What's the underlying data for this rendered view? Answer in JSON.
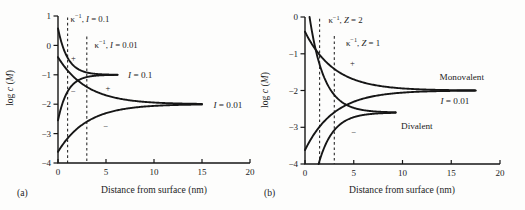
{
  "figure": {
    "background": "#fdfdfc",
    "line_color": "#161616",
    "dash_color": "#2b2b2b",
    "text_color": "#1c1c1c"
  },
  "chart_data": [
    {
      "type": "line",
      "panel_label": "(a)",
      "xlabel": "Distance from surface (nm)",
      "ylabel_parts": [
        {
          "t": "log "
        },
        {
          "t": "c",
          "style": "italic"
        },
        {
          "t": " ("
        },
        {
          "t": "M",
          "style": "italic"
        },
        {
          "t": ")"
        }
      ],
      "xlim": [
        0,
        20
      ],
      "ylim": [
        -4,
        1
      ],
      "xticks": [
        0,
        5,
        10,
        15,
        20
      ],
      "yticks": [
        1,
        0,
        -1,
        -2,
        -3,
        -4
      ],
      "debye_lines": [
        {
          "x_nm": 1.0,
          "y_top": 0.95,
          "label_parts": [
            {
              "t": "κ"
            },
            {
              "t": "−1",
              "style": "sup"
            },
            {
              "t": ", "
            },
            {
              "t": "I",
              "style": "italic"
            },
            {
              "t": " = 0.1"
            }
          ],
          "label_at": {
            "x": 1.3,
            "y": 0.91
          }
        },
        {
          "x_nm": 3.0,
          "y_top": 0.3,
          "label_parts": [
            {
              "t": "κ"
            },
            {
              "t": "−1",
              "style": "sup"
            },
            {
              "t": ", "
            },
            {
              "t": "I",
              "style": "italic"
            },
            {
              "t": " = 0.01"
            }
          ],
          "label_at": {
            "x": 3.8,
            "y": 0.03
          }
        }
      ],
      "series": [
        {
          "name": "counterion-I-0.1",
          "ion_sign": "+",
          "bulk_log_c": -1,
          "surface_delta": 1.58,
          "decay_nm": 1.0,
          "x_end_nm": 6.2
        },
        {
          "name": "coion-I-0.1",
          "ion_sign": "−",
          "bulk_log_c": -1,
          "surface_delta": -1.55,
          "decay_nm": 1.0,
          "x_end_nm": 6.2
        },
        {
          "name": "counterion-I-0.01",
          "ion_sign": "+",
          "bulk_log_c": -2,
          "surface_delta": 1.6,
          "decay_nm": 3.0,
          "x_end_nm": 15.0
        },
        {
          "name": "coion-I-0.01",
          "ion_sign": "−",
          "bulk_log_c": -2,
          "surface_delta": -1.62,
          "decay_nm": 3.0,
          "x_end_nm": 15.0
        }
      ],
      "curve_labels": [
        {
          "parts": [
            {
              "t": "I",
              "style": "italic"
            },
            {
              "t": " = 0.1"
            }
          ],
          "x": 7.3,
          "y": -1.0
        },
        {
          "parts": [
            {
              "t": "I",
              "style": "italic"
            },
            {
              "t": " = 0.01"
            }
          ],
          "x": 16.2,
          "y": -2.02
        }
      ],
      "sign_markers": [
        {
          "t": "+",
          "x": 1.6,
          "y": -0.43
        },
        {
          "t": "−",
          "x": 1.6,
          "y": -1.56
        },
        {
          "t": "+",
          "x": 5.2,
          "y": -1.44
        },
        {
          "t": "−",
          "x": 5.0,
          "y": -2.75
        }
      ]
    },
    {
      "type": "line",
      "panel_label": "(b)",
      "xlabel": "Distance from surface (nm)",
      "ylabel_parts": [
        {
          "t": "log "
        },
        {
          "t": "c",
          "style": "italic"
        },
        {
          "t": " ("
        },
        {
          "t": "M",
          "style": "italic"
        },
        {
          "t": ")"
        }
      ],
      "xlim": [
        0,
        20
      ],
      "ylim": [
        -4,
        0
      ],
      "xticks": [
        0,
        5,
        10,
        15,
        20
      ],
      "yticks": [
        0,
        -1,
        -2,
        -3,
        -4
      ],
      "debye_lines": [
        {
          "x_nm": 1.5,
          "y_top": -0.05,
          "label_parts": [
            {
              "t": "κ"
            },
            {
              "t": "−1",
              "style": "sup"
            },
            {
              "t": ", "
            },
            {
              "t": "Z",
              "style": "italic"
            },
            {
              "t": " = 2"
            }
          ],
          "label_at": {
            "x": 2.4,
            "y": -0.08
          }
        },
        {
          "x_nm": 3.0,
          "y_top": -0.52,
          "label_parts": [
            {
              "t": "κ"
            },
            {
              "t": "−1",
              "style": "sup"
            },
            {
              "t": ", "
            },
            {
              "t": "Z",
              "style": "italic"
            },
            {
              "t": " = 1"
            }
          ],
          "label_at": {
            "x": 4.2,
            "y": -0.7
          }
        }
      ],
      "series": [
        {
          "name": "monovalent-counterion",
          "ion_sign": "+",
          "bulk_log_c": -2,
          "surface_delta": 1.6,
          "decay_nm": 3.0,
          "x_end_nm": 17.5
        },
        {
          "name": "monovalent-coion",
          "ion_sign": "−",
          "bulk_log_c": -2,
          "surface_delta": -1.62,
          "decay_nm": 3.0,
          "x_end_nm": 17.5
        },
        {
          "name": "divalent-counterion",
          "ion_sign": "+",
          "bulk_log_c": -2.6,
          "surface_delta": 3.55,
          "decay_nm": 1.5,
          "x_end_nm": 9.3
        },
        {
          "name": "divalent-coion",
          "ion_sign": "−",
          "bulk_log_c": -2.6,
          "surface_delta": -3.55,
          "decay_nm": 1.5,
          "x_end_nm": 9.3
        }
      ],
      "curve_labels": [
        {
          "parts": [
            {
              "t": "Monovalent"
            }
          ],
          "x": 13.8,
          "y": -1.62
        },
        {
          "parts": [
            {
              "t": "I",
              "style": "italic"
            },
            {
              "t": " = 0.01"
            }
          ],
          "x": 13.9,
          "y": -2.28
        },
        {
          "parts": [
            {
              "t": "Divalent"
            }
          ],
          "x": 9.85,
          "y": -2.95
        }
      ],
      "sign_markers": [
        {
          "t": "+",
          "x": 4.85,
          "y": -1.25
        },
        {
          "t": "−",
          "x": 5.0,
          "y": -3.12
        }
      ]
    }
  ]
}
